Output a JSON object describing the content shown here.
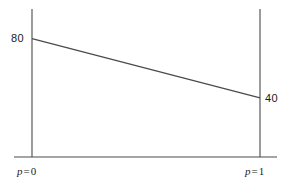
{
  "figure": {
    "background_color": "#ffffff",
    "stroke_color": "#4a4a4a",
    "text_color": "#1b1b1b"
  },
  "labels": {
    "left_value": "80",
    "right_value": "40",
    "left_axis_var": "p",
    "left_axis_eq": "=",
    "left_axis_val": "0",
    "right_axis_var": "p",
    "right_axis_eq": "=",
    "right_axis_val": "1"
  },
  "chart_data": {
    "type": "line",
    "title": "",
    "xlabel": "",
    "ylabel": "",
    "x": [
      0,
      1
    ],
    "xticklabels": [
      "p = 0",
      "p = 1"
    ],
    "series": [
      {
        "name": "payoff",
        "values": [
          80,
          40
        ],
        "endpoint_labels": [
          "80",
          "40"
        ],
        "color": "#4a4a4a"
      }
    ],
    "xlim": [
      0,
      1
    ],
    "ylim": [
      0,
      100
    ],
    "grid": false,
    "legend": false,
    "axes": {
      "left_vertical_axis": true,
      "right_vertical_axis": true,
      "baseline": true,
      "ticks": [
        "p = 0",
        "p = 1"
      ]
    },
    "annotations": [
      {
        "text": "80",
        "x": 0,
        "y": 80,
        "position": "left"
      },
      {
        "text": "40",
        "x": 1,
        "y": 40,
        "position": "right"
      }
    ]
  }
}
